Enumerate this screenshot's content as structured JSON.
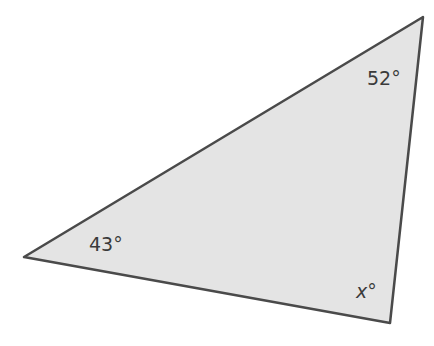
{
  "diagram": {
    "type": "triangle",
    "fill_color": "#e4e4e4",
    "stroke_color": "#4a4a4a",
    "vertices": {
      "top_right": [
        423,
        17
      ],
      "left": [
        24,
        257
      ],
      "bottom_right": [
        390,
        323
      ]
    },
    "angles": {
      "top_right": {
        "value": "52",
        "unit": "°"
      },
      "left": {
        "value": "43",
        "unit": "°"
      },
      "bottom_right": {
        "value": "x",
        "unit": "°"
      }
    }
  }
}
